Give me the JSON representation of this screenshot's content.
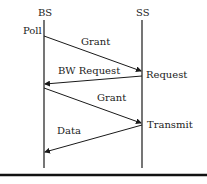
{
  "entities": [
    {
      "name": "BS",
      "x": 44
    },
    {
      "name": "SS",
      "x": 142
    }
  ],
  "events": {
    "bs_poll": "Poll",
    "ss_request": "Request",
    "ss_transmit": "Transmit"
  },
  "messages": [
    {
      "label": "Grant",
      "from": "BS",
      "to": "SS"
    },
    {
      "label": "BW Request",
      "from": "SS",
      "to": "BS"
    },
    {
      "label": "Grant",
      "from": "BS",
      "to": "SS"
    },
    {
      "label": "Data",
      "from": "SS",
      "to": "BS"
    }
  ],
  "colors": {
    "line": "#1a1a1a",
    "text": "#222222"
  }
}
